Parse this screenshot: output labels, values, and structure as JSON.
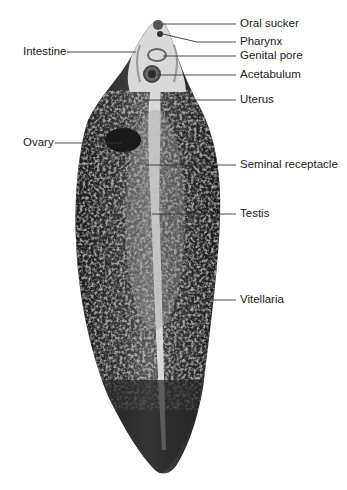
{
  "figure": {
    "colors": {
      "body_dark": "#1e1e1e",
      "body_mid": "#555555",
      "body_light": "#cfcfcf",
      "leader": "#333333",
      "text": "#222222"
    },
    "labels": [
      {
        "id": "oral-sucker",
        "text": "Oral sucker",
        "side": "right"
      },
      {
        "id": "pharynx",
        "text": "Pharynx",
        "side": "right"
      },
      {
        "id": "genital-pore",
        "text": "Genital pore",
        "side": "right"
      },
      {
        "id": "acetabulum",
        "text": "Acetabulum",
        "side": "right"
      },
      {
        "id": "uterus",
        "text": "Uterus",
        "side": "right"
      },
      {
        "id": "seminal-receptacle",
        "text": "Seminal receptacle",
        "side": "right"
      },
      {
        "id": "testis",
        "text": "Testis",
        "side": "right"
      },
      {
        "id": "vitellaria",
        "text": "Vitellaria",
        "side": "right"
      },
      {
        "id": "intestine",
        "text": "Intestine",
        "side": "left"
      },
      {
        "id": "ovary",
        "text": "Ovary",
        "side": "left"
      }
    ]
  }
}
